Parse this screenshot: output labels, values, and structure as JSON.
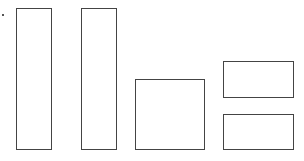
{
  "diagram": {
    "stroke_color": "#444444",
    "fill_color": "#ffffff",
    "shapes": [
      {
        "id": "tall-rectangle-1",
        "kind": "rectangle"
      },
      {
        "id": "tall-rectangle-2",
        "kind": "rectangle"
      },
      {
        "id": "square",
        "kind": "square"
      },
      {
        "id": "wide-rectangle-top",
        "kind": "rectangle"
      },
      {
        "id": "wide-rectangle-bottom",
        "kind": "rectangle"
      }
    ]
  }
}
